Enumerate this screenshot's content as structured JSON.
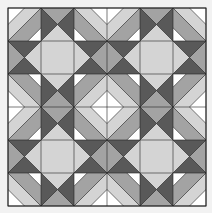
{
  "image": {
    "title": "Quilt block pattern",
    "description": "6x6 unit geometric quilt with concentric diamonds, large light diamonds and dark hourglass triangles"
  },
  "layout": {
    "origin_px": 8,
    "unit_px": 33,
    "grid_units": 6
  },
  "colors": {
    "background": "#f2f2f2",
    "white": "#ffffff",
    "light": "#d4d4d4",
    "medium": "#a3a3a3",
    "dark": "#595959",
    "line": "#222222"
  },
  "motifs": {
    "concentric_centers": [
      [
        0,
        0
      ],
      [
        3,
        0
      ],
      [
        6,
        0
      ],
      [
        0,
        3
      ],
      [
        3,
        3
      ],
      [
        6,
        3
      ],
      [
        0,
        6
      ],
      [
        3,
        6
      ],
      [
        6,
        6
      ]
    ],
    "concentric_bands": [
      {
        "color": "white",
        "radius": 2.0
      },
      {
        "color": "medium",
        "radius": 1.6
      },
      {
        "color": "light",
        "radius": 1.0
      },
      {
        "color": "white",
        "radius": 0.5
      }
    ],
    "large_diamonds": [
      [
        1.5,
        1.5
      ],
      [
        4.5,
        1.5
      ],
      [
        1.5,
        4.5
      ],
      [
        4.5,
        4.5
      ]
    ],
    "large_diamond_radius": 1.0,
    "hourglass_medium_centers": [
      [
        1.5,
        0
      ],
      [
        4.5,
        0
      ],
      [
        0,
        1.5
      ],
      [
        3,
        1.5
      ],
      [
        6,
        1.5
      ],
      [
        1.5,
        3
      ],
      [
        4.5,
        3
      ],
      [
        0,
        4.5
      ],
      [
        3,
        4.5
      ],
      [
        6,
        4.5
      ],
      [
        1.5,
        6
      ],
      [
        4.5,
        6
      ]
    ],
    "hourglass_medium_radius": 0.5
  }
}
